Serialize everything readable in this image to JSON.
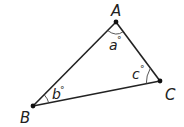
{
  "diagram": {
    "type": "triangle",
    "vertices": [
      {
        "id": "A",
        "label": "A",
        "x": 116,
        "y": 22
      },
      {
        "id": "B",
        "label": "B",
        "x": 33,
        "y": 106
      },
      {
        "id": "C",
        "label": "C",
        "x": 160,
        "y": 81
      }
    ],
    "angles": [
      {
        "vertex": "A",
        "label": "a",
        "degree_symbol": "°"
      },
      {
        "vertex": "B",
        "label": "b",
        "degree_symbol": "°"
      },
      {
        "vertex": "C",
        "label": "c",
        "degree_symbol": "°"
      }
    ],
    "colors": {
      "stroke": "#222222",
      "background": "#ffffff"
    }
  }
}
